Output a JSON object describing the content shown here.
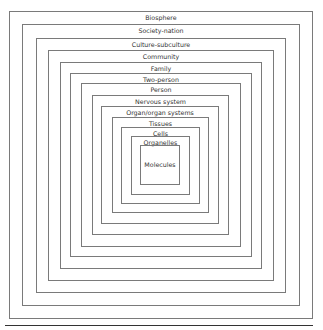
{
  "diagram": {
    "type": "nested-squares",
    "levels": [
      {
        "label": "Biosphere",
        "x": 9,
        "y": 11,
        "w": 304,
        "h": 308
      },
      {
        "label": "Society-nation",
        "x": 22,
        "y": 24,
        "w": 278,
        "h": 282
      },
      {
        "label": "Culture-subculture",
        "x": 36,
        "y": 38,
        "w": 250,
        "h": 255
      },
      {
        "label": "Community",
        "x": 48,
        "y": 50,
        "w": 226,
        "h": 231
      },
      {
        "label": "Family",
        "x": 60,
        "y": 62,
        "w": 202,
        "h": 207
      },
      {
        "label": "Two-person",
        "x": 70,
        "y": 73,
        "w": 182,
        "h": 184
      },
      {
        "label": "Person",
        "x": 81,
        "y": 83,
        "w": 160,
        "h": 164
      },
      {
        "label": "Nervous system",
        "x": 92,
        "y": 95,
        "w": 137,
        "h": 140
      },
      {
        "label": "Organ/organ systems",
        "x": 101,
        "y": 106,
        "w": 118,
        "h": 118
      },
      {
        "label": "Tissues",
        "x": 112,
        "y": 117,
        "w": 97,
        "h": 96
      },
      {
        "label": "Cells",
        "x": 121,
        "y": 127,
        "w": 79,
        "h": 77
      },
      {
        "label": "Organelles",
        "x": 131,
        "y": 136,
        "w": 59,
        "h": 59
      },
      {
        "label": "Molecules",
        "x": 140,
        "y": 145,
        "w": 40,
        "h": 40
      }
    ]
  }
}
